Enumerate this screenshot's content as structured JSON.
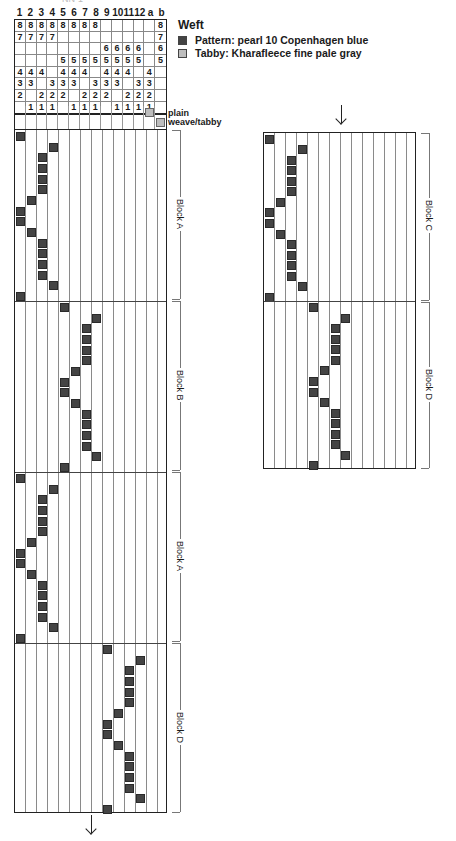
{
  "header": {
    "column_numbers": [
      "1",
      "2",
      "3",
      "4",
      "5",
      "6",
      "7",
      "8",
      "9",
      "10",
      "11",
      "12",
      "a",
      "b"
    ]
  },
  "tieup": {
    "rows": [
      [
        "8",
        "8",
        "8",
        "8",
        "8",
        "8",
        "8",
        "8",
        "",
        "",
        "",
        "",
        "",
        "8"
      ],
      [
        "7",
        "7",
        "7",
        "7",
        "",
        "",
        "",
        "",
        "",
        "",
        "",
        "",
        "",
        "7"
      ],
      [
        "",
        "",
        "",
        "",
        "",
        "",
        "",
        "",
        "6",
        "6",
        "6",
        "6",
        "",
        "6"
      ],
      [
        "",
        "",
        "",
        "",
        "5",
        "5",
        "5",
        "5",
        "5",
        "5",
        "5",
        "5",
        "",
        "5"
      ],
      [
        "4",
        "4",
        "4",
        "",
        "4",
        "4",
        "4",
        "",
        "4",
        "4",
        "4",
        "",
        "4",
        ""
      ],
      [
        "3",
        "3",
        "",
        "3",
        "3",
        "3",
        "",
        "3",
        "3",
        "3",
        "",
        "3",
        "3",
        ""
      ],
      [
        "2",
        "",
        "2",
        "2",
        "2",
        "",
        "2",
        "2",
        "2",
        "",
        "2",
        "2",
        "2",
        ""
      ],
      [
        "",
        "1",
        "1",
        "1",
        "",
        "1",
        "1",
        "1",
        "",
        "1",
        "1",
        "1",
        "1",
        ""
      ]
    ],
    "tabby_treadles": [
      "a",
      "b"
    ]
  },
  "legend": {
    "title": "Weft",
    "pattern_label": "Pattern:  pearl 10 Copenhagen blue",
    "tabby_label": "Tabby:  Kharafleece fine pale gray",
    "pattern_color": "#444444",
    "tabby_color": "#bdbdbd",
    "plain_weave_line1": "plain",
    "plain_weave_line2": "weave/tabby"
  },
  "left_draft": {
    "blocks": [
      {
        "label": "Block A",
        "treadles": [
          1,
          4,
          3,
          3,
          3,
          3,
          2,
          1,
          1,
          2,
          3,
          3,
          3,
          3,
          4,
          1
        ]
      },
      {
        "label": "Block B",
        "treadles": [
          5,
          8,
          7,
          7,
          7,
          7,
          6,
          5,
          5,
          6,
          7,
          7,
          7,
          7,
          8,
          5
        ]
      },
      {
        "label": "Block A",
        "treadles": [
          1,
          4,
          3,
          3,
          3,
          3,
          2,
          1,
          1,
          2,
          3,
          3,
          3,
          3,
          4,
          1
        ]
      },
      {
        "label": "Block D",
        "treadles": [
          9,
          12,
          11,
          11,
          11,
          11,
          10,
          9,
          9,
          10,
          11,
          11,
          11,
          11,
          12,
          9
        ]
      }
    ]
  },
  "right_draft": {
    "blocks": [
      {
        "label": "Block C",
        "treadles": [
          1,
          4,
          3,
          3,
          3,
          3,
          2,
          1,
          1,
          2,
          3,
          3,
          3,
          3,
          4,
          1
        ]
      },
      {
        "label": "Block D",
        "treadles": [
          5,
          8,
          7,
          7,
          7,
          7,
          6,
          5,
          5,
          6,
          7,
          7,
          7,
          7,
          8,
          5
        ]
      }
    ]
  },
  "colors": {
    "grid_line": "#8a8a8a",
    "border": "#222222",
    "pattern_pick": "#444444",
    "tabby_pick": "#bdbdbd"
  }
}
